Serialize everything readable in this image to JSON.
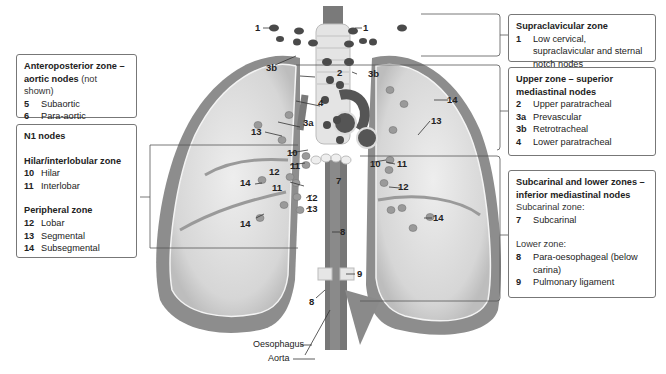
{
  "left_panels": {
    "anteroposterior": {
      "title": "Anteroposterior zone – aortic nodes",
      "note": "(not shown)",
      "items": [
        {
          "num": "5",
          "label": "Subaortic"
        },
        {
          "num": "6",
          "label": "Para-aortic"
        }
      ]
    },
    "n1": {
      "title": "N1 nodes",
      "hilar_title": "Hilar/interlobular zone",
      "hilar_items": [
        {
          "num": "10",
          "label": "Hilar"
        },
        {
          "num": "11",
          "label": "Interlobar"
        }
      ],
      "peripheral_title": "Peripheral zone",
      "peripheral_items": [
        {
          "num": "12",
          "label": "Lobar"
        },
        {
          "num": "13",
          "label": "Segmental"
        },
        {
          "num": "14",
          "label": "Subsegmental"
        }
      ]
    }
  },
  "right_panels": {
    "supraclavicular": {
      "title": "Supraclavicular zone",
      "items": [
        {
          "num": "1",
          "label": "Low cervical, supraclavicular and sternal notch nodes"
        }
      ]
    },
    "upper": {
      "title": "Upper zone – superior mediastinal nodes",
      "items": [
        {
          "num": "2",
          "label": "Upper paratracheal"
        },
        {
          "num": "3a",
          "label": "Prevascular"
        },
        {
          "num": "3b",
          "label": "Retrotracheal"
        },
        {
          "num": "4",
          "label": "Lower paratracheal"
        }
      ]
    },
    "subcarinal": {
      "title": "Subcarinal and lower zones – inferior mediastinal nodes",
      "subcarinal_heading": "Subcarinal zone:",
      "subcarinal_items": [
        {
          "num": "7",
          "label": "Subcarinal"
        }
      ],
      "lower_heading": "Lower zone:",
      "lower_items": [
        {
          "num": "8",
          "label": "Para-oesophageal (below carina)"
        },
        {
          "num": "9",
          "label": "Pulmonary ligament"
        }
      ]
    }
  },
  "diagram_labels": {
    "n1a": "1",
    "n1b": "1",
    "n3b_l": "3b",
    "n3b_r": "3b",
    "n2": "2",
    "n4": "4",
    "n3a": "3a",
    "n14_ru": "14",
    "n13_r": "13",
    "n13_l": "13",
    "n10_l": "10",
    "n10_r": "10",
    "n11_l": "11",
    "n11_r": "11",
    "n11_l2": "11",
    "n12_l": "12",
    "n12_l2": "12",
    "n12_r": "12",
    "n14_l": "14",
    "n14_l2": "14",
    "n14_r": "14",
    "n13_l2": "13",
    "n7": "7",
    "n8": "8",
    "n8b": "8",
    "n9": "9"
  },
  "anatomy_labels": {
    "oesophagus": "Oesophagus",
    "aorta": "Aorta"
  },
  "colors": {
    "lung_outer": "#8a8a8a",
    "lung_inner": "#d9d9d9",
    "node": "#4a4a4a",
    "node_light": "#9a9a9a",
    "box_border": "#777777"
  }
}
